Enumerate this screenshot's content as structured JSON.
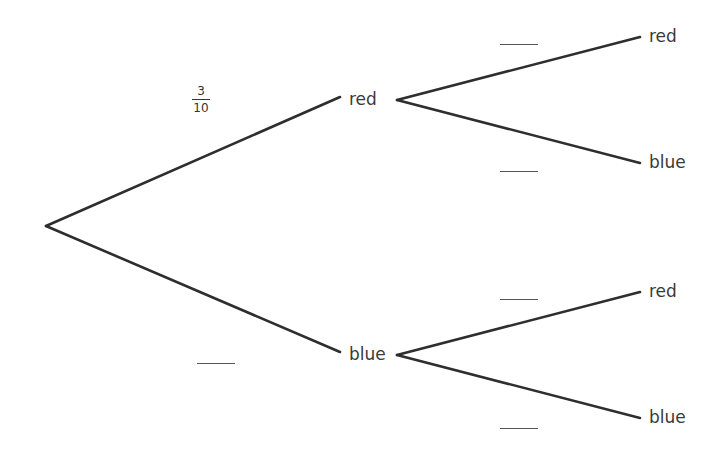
{
  "diagram": {
    "type": "probability-tree",
    "first_branch": {
      "red": {
        "label": "red",
        "probability": {
          "numerator": "3",
          "denominator": "10"
        }
      },
      "blue": {
        "label": "blue",
        "probability": "blank"
      }
    },
    "second_branch_after_red": {
      "red": {
        "label": "red",
        "probability": "blank"
      },
      "blue": {
        "label": "blue",
        "probability": "blank"
      }
    },
    "second_branch_after_blue": {
      "red": {
        "label": "red",
        "probability": "blank"
      },
      "blue": {
        "label": "blue",
        "probability": "blank"
      }
    }
  }
}
